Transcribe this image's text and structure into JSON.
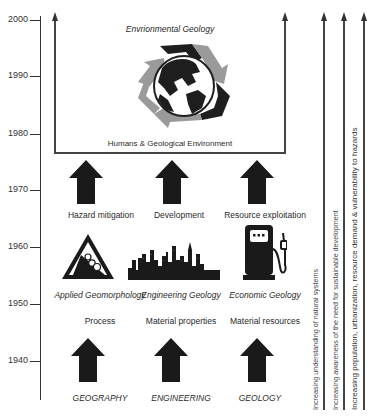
{
  "timeline": {
    "ticks": [
      "2000",
      "1990",
      "1980",
      "1970",
      "1960",
      "1950",
      "1940"
    ]
  },
  "top_box": {
    "title": "Envrionmental Geology",
    "subtitle": "Humans & Geological Environment",
    "icon": "recycle-globe-icon"
  },
  "columns": [
    {
      "root": "GEOGRAPHY",
      "focus": "Process",
      "discipline": "Applied Geomorphology",
      "discipline_icon": "falling-rocks-warning-icon",
      "application": "Hazard mitigation"
    },
    {
      "root": "ENGINEERING",
      "focus": "Material properties",
      "discipline": "Engineering Geology",
      "discipline_icon": "city-skyline-icon",
      "application": "Development"
    },
    {
      "root": "GEOLOGY",
      "focus": "Material resources",
      "discipline": "Economic Geology",
      "discipline_icon": "fuel-pump-icon",
      "application": "Resource exploitation"
    }
  ],
  "trends": [
    "Increasing understanding of natural systems",
    "Increasing awareness of the need for sustainable development",
    "Increasing population, urbanization, resource demand & vulnerability to hazards"
  ],
  "colors": {
    "line": "#444444",
    "arrow_fill": "#1a1a1a",
    "recycle_light": "#9a9a9a",
    "recycle_dark": "#1e1e1e"
  }
}
